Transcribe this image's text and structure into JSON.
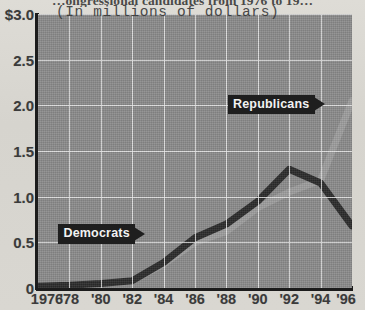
{
  "headline": "…ongressional candidates from 1976 to 19…",
  "subtitle": "(In millions of dollars)",
  "annotations": {
    "republicans_label": "Republicans",
    "democrats_label": "Democrats"
  },
  "colors": {
    "plot_background": "#8b8b8b",
    "page_background": "#d8d7d2",
    "gridline": "#e9e9e9",
    "axis": "#1c1c1c",
    "democrats_line": "#2b2b2b",
    "republicans_line": "#9d9d9d",
    "callout_background": "#1e1e1e",
    "callout_text": "#f2f2f2"
  },
  "chart_data": {
    "type": "line",
    "title": "…ongressional candidates from 1976 to 19…",
    "subtitle": "(In millions of dollars)",
    "xlabel": "",
    "ylabel": "",
    "grid": true,
    "legend_position": "inline-annotations",
    "x": [
      1976,
      1978,
      1980,
      1982,
      1984,
      1986,
      1988,
      1990,
      1992,
      1994,
      1996
    ],
    "tick_labels": [
      "1976",
      "'78",
      "'80",
      "'82",
      "'84",
      "'86",
      "'88",
      "'90",
      "'92",
      "'94",
      "'96"
    ],
    "ylim": [
      0,
      3.0
    ],
    "xlim": [
      1976,
      1996
    ],
    "yticks": [
      0,
      0.5,
      1.0,
      1.5,
      2.0,
      2.5,
      3.0
    ],
    "ytick_labels": [
      "0",
      "0.5",
      "1.0",
      "1.5",
      "2.0",
      "2.5",
      "$3.0"
    ],
    "series": [
      {
        "name": "Democrats",
        "color": "#2b2b2b",
        "values": [
          0.02,
          0.03,
          0.05,
          0.08,
          0.28,
          0.55,
          0.7,
          0.95,
          1.3,
          1.15,
          0.68
        ]
      },
      {
        "name": "Republicans",
        "color": "#9d9d9d",
        "values": [
          0.02,
          0.03,
          0.05,
          0.08,
          0.26,
          0.5,
          0.62,
          0.88,
          1.05,
          1.18,
          2.05
        ]
      }
    ]
  }
}
